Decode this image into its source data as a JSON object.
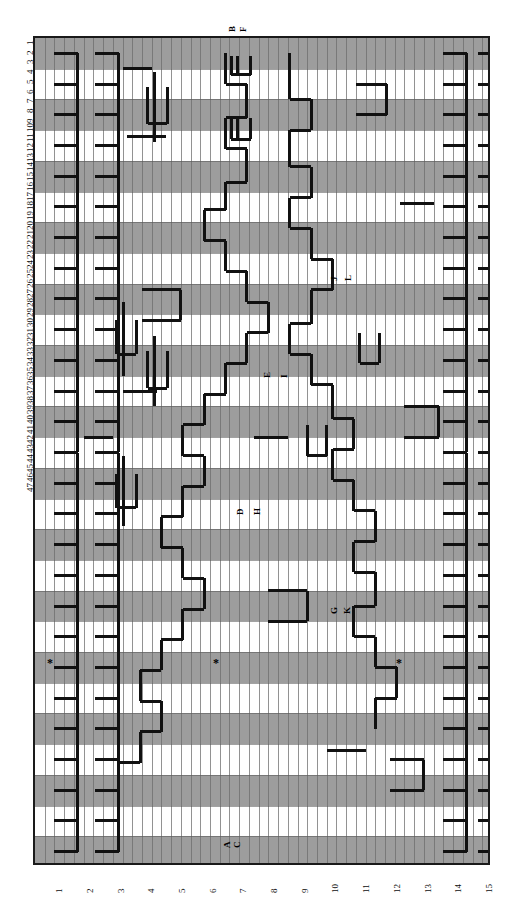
{
  "figure": {
    "type": "grid-trace-diagram",
    "orientation": "rotated-90-ccw",
    "frame": {
      "x": 33,
      "y": 36,
      "width": 457,
      "height": 829
    },
    "background_color": "#ffffff",
    "band_color": "#9d9d9d",
    "trace_color": "#111111",
    "grid_color": "#6e6e6e"
  },
  "axes": {
    "top_axis": {
      "name": "column-index-axis",
      "orientation": "vertical-text-left-edge",
      "count": 47,
      "labels": [
        "1",
        "2",
        "3",
        "4",
        "5",
        "6",
        "7",
        "8",
        "9",
        "10",
        "11",
        "12",
        "13",
        "14",
        "15",
        "16",
        "17",
        "18",
        "19",
        "20",
        "21",
        "22",
        "23",
        "24",
        "25",
        "26",
        "27",
        "28",
        "29",
        "30",
        "31",
        "32",
        "33",
        "34",
        "35",
        "36",
        "37",
        "38",
        "39",
        "40",
        "41",
        "42",
        "43",
        "44",
        "45",
        "46",
        "47"
      ]
    },
    "bottom_axis": {
      "name": "row-index-axis",
      "orientation": "vertical-text-bottom-edge",
      "count": 27,
      "labels": [
        "1",
        "2",
        "3",
        "4",
        "5",
        "6",
        "7",
        "8",
        "9",
        "10",
        "11",
        "12",
        "13",
        "14",
        "15",
        "16",
        "17",
        "18",
        "19",
        "20",
        "21",
        "22",
        "23",
        "24",
        "25",
        "26",
        "27"
      ]
    }
  },
  "markers": {
    "letters": [
      {
        "id": "A",
        "label": "A",
        "x": 223,
        "y": 848
      },
      {
        "id": "C",
        "label": "C",
        "x": 233,
        "y": 848
      },
      {
        "id": "B",
        "label": "B",
        "x": 228,
        "y": 32
      },
      {
        "id": "F",
        "label": "F",
        "x": 239,
        "y": 32
      },
      {
        "id": "D",
        "label": "D",
        "x": 236,
        "y": 515
      },
      {
        "id": "H",
        "label": "H",
        "x": 253,
        "y": 515
      },
      {
        "id": "E",
        "label": "E",
        "x": 263,
        "y": 378
      },
      {
        "id": "I",
        "label": "I",
        "x": 280,
        "y": 378
      },
      {
        "id": "G",
        "label": "G",
        "x": 330,
        "y": 614
      },
      {
        "id": "K",
        "label": "K",
        "x": 343,
        "y": 614
      },
      {
        "id": "J",
        "label": "J",
        "x": 330,
        "y": 281
      },
      {
        "id": "L",
        "label": "L",
        "x": 344,
        "y": 281
      }
    ],
    "asterisks": [
      {
        "id": "star-1",
        "glyph": "*",
        "x": 47,
        "y": 657
      },
      {
        "id": "star-2",
        "glyph": "*",
        "x": 213,
        "y": 657
      },
      {
        "id": "star-3",
        "glyph": "*",
        "x": 396,
        "y": 657
      }
    ]
  },
  "chart_data": {
    "type": "heatmap",
    "title": "",
    "xlabel": "",
    "ylabel": "",
    "n_columns": 47,
    "n_rows": 27,
    "band_rows_shaded": [
      1,
      3,
      5,
      7,
      9,
      11,
      13,
      15,
      17,
      19,
      21,
      23,
      25,
      27
    ],
    "note": "Alternating shaded horizontal bands with bold black stair-step trace polylines overlaid; letter markers A-L and three asterisk annotations."
  },
  "traces": [
    [
      [
        2,
        1
      ],
      [
        2,
        47
      ]
    ],
    [
      [
        4,
        1
      ],
      [
        4,
        47
      ]
    ],
    [
      [
        12,
        1
      ],
      [
        12,
        14
      ]
    ],
    [
      [
        13,
        1
      ],
      [
        13,
        13
      ]
    ],
    [
      [
        23,
        1
      ],
      [
        23,
        47
      ]
    ],
    [
      [
        25,
        1
      ],
      [
        25,
        47
      ]
    ]
  ]
}
